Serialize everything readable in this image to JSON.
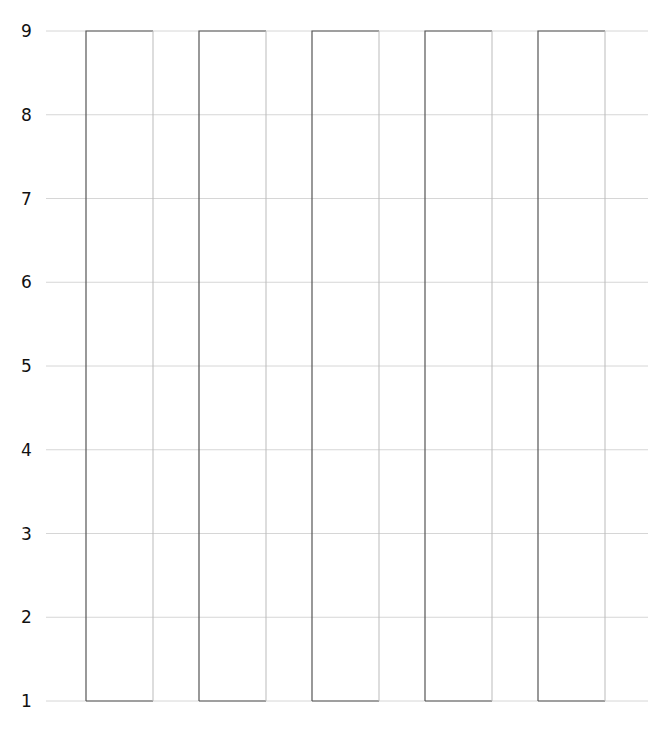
{
  "chart_data": {
    "type": "bar",
    "title": "",
    "xlabel": "",
    "ylabel": "",
    "categories": [
      "",
      "",
      "",
      "",
      ""
    ],
    "series": [
      {
        "name": "",
        "values": [
          9,
          9,
          9,
          9,
          9
        ],
        "base": 1
      }
    ],
    "ylim": [
      1,
      9
    ],
    "yticks": [
      1,
      2,
      3,
      4,
      5,
      6,
      7,
      8,
      9
    ],
    "grid": true,
    "legend": "none",
    "bar_fill": "none",
    "bar_stroke": "#555555",
    "grid_color": "#d6d6d6"
  }
}
